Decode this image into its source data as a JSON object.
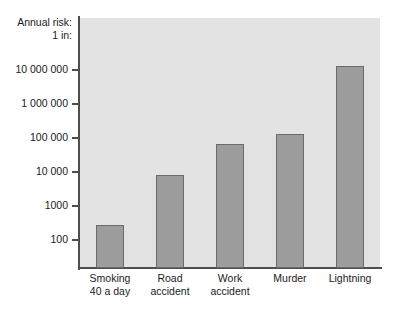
{
  "chart_data": {
    "type": "bar",
    "title": "",
    "subtitle": "",
    "caption_line1": "Annual risk:",
    "caption_line2": "1 in:",
    "xlabel": "",
    "ylabel": "Annual risk: 1 in:",
    "yscale": "log",
    "ylim": [
      40,
      40000000
    ],
    "grid": false,
    "legend": null,
    "categories": [
      "Smoking 40 a day",
      "Road accident",
      "Work accident",
      "Murder",
      "Lightning"
    ],
    "category_lines": [
      [
        "Smoking",
        "40 a day"
      ],
      [
        "Road",
        "accident"
      ],
      [
        "Work",
        "accident"
      ],
      [
        "Murder",
        ""
      ],
      [
        "Lightning",
        ""
      ]
    ],
    "values": [
      275,
      8000,
      65000,
      130000,
      13000000
    ],
    "ticks": [
      {
        "value": 10000000,
        "label": "10 000 000"
      },
      {
        "value": 1000000,
        "label": "1 000 000"
      },
      {
        "value": 100000,
        "label": "100 000"
      },
      {
        "value": 10000,
        "label": "10 000"
      },
      {
        "value": 1000,
        "label": "1000"
      },
      {
        "value": 100,
        "label": "100"
      }
    ],
    "colors": {
      "bar_fill": "#9c9c9c",
      "bar_border": "#6b6b6b",
      "plot_background": "#e3e3e3",
      "axis": "#4d4d4d",
      "text": "#1a1a1a",
      "page_background": "#ffffff"
    }
  }
}
